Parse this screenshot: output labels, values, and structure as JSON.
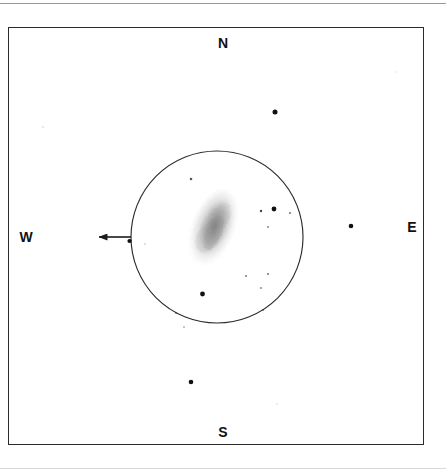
{
  "sketch": {
    "title": "Telescope eyepiece field sketch",
    "background_color": "#ffffff",
    "ink_color": "#2b2b2b",
    "frame": {
      "x": 8,
      "y": 27,
      "width": 416,
      "height": 418
    },
    "compass": {
      "north_label": "N",
      "south_label": "S",
      "west_label": "W",
      "east_label": "E"
    },
    "field_of_view_circle": {
      "cx": 217,
      "cy": 237,
      "r": 86
    },
    "object": {
      "name": "galaxy-smudge",
      "cx": 213,
      "cy": 228,
      "rx": 22,
      "ry": 41,
      "rotation_deg": 20,
      "shade_color": "#9a9a9a"
    },
    "pointer_arrow": {
      "from_x": 131,
      "from_y": 237,
      "to_x": 95,
      "to_y": 237,
      "direction": "west",
      "target_star_index": 0
    },
    "stars": [
      {
        "cx": 129.5,
        "cy": 241.0,
        "r": 2.1,
        "opacity": 1.0,
        "inside_circle": true
      },
      {
        "cx": 275.0,
        "cy": 112.0,
        "r": 2.5,
        "opacity": 1.0,
        "inside_circle": false
      },
      {
        "cx": 351.0,
        "cy": 226.0,
        "r": 2.3,
        "opacity": 1.0,
        "inside_circle": false
      },
      {
        "cx": 191.0,
        "cy": 382.0,
        "r": 2.3,
        "opacity": 1.0,
        "inside_circle": false
      },
      {
        "cx": 274.0,
        "cy": 209.0,
        "r": 2.4,
        "opacity": 1.0,
        "inside_circle": true
      },
      {
        "cx": 202.5,
        "cy": 294.0,
        "r": 2.4,
        "opacity": 1.0,
        "inside_circle": true
      },
      {
        "cx": 261.0,
        "cy": 211.0,
        "r": 1.2,
        "opacity": 0.78,
        "inside_circle": true
      },
      {
        "cx": 290.0,
        "cy": 213.0,
        "r": 1.1,
        "opacity": 0.55,
        "inside_circle": true
      },
      {
        "cx": 268.0,
        "cy": 227.0,
        "r": 1.0,
        "opacity": 0.5,
        "inside_circle": true
      },
      {
        "cx": 191.0,
        "cy": 179.0,
        "r": 1.3,
        "opacity": 0.7,
        "inside_circle": true
      },
      {
        "cx": 246.0,
        "cy": 276.0,
        "r": 1.1,
        "opacity": 0.52,
        "inside_circle": true
      },
      {
        "cx": 268.0,
        "cy": 274.0,
        "r": 1.1,
        "opacity": 0.55,
        "inside_circle": true
      },
      {
        "cx": 261.0,
        "cy": 288.0,
        "r": 1.0,
        "opacity": 0.48,
        "inside_circle": true
      },
      {
        "cx": 263.0,
        "cy": 310.0,
        "r": 1.1,
        "opacity": 0.5,
        "inside_circle": true
      },
      {
        "cx": 176.0,
        "cy": 313.0,
        "r": 1.0,
        "opacity": 0.45,
        "inside_circle": true
      },
      {
        "cx": 184.0,
        "cy": 327.0,
        "r": 0.9,
        "opacity": 0.35,
        "inside_circle": true
      },
      {
        "cx": 145.0,
        "cy": 244.0,
        "r": 0.8,
        "opacity": 0.3,
        "inside_circle": true
      },
      {
        "cx": 43.0,
        "cy": 127.0,
        "r": 0.8,
        "opacity": 0.22,
        "inside_circle": false
      },
      {
        "cx": 277.0,
        "cy": 404.0,
        "r": 0.8,
        "opacity": 0.2,
        "inside_circle": false
      },
      {
        "cx": 396.0,
        "cy": 72.0,
        "r": 0.7,
        "opacity": 0.18,
        "inside_circle": false
      }
    ]
  }
}
